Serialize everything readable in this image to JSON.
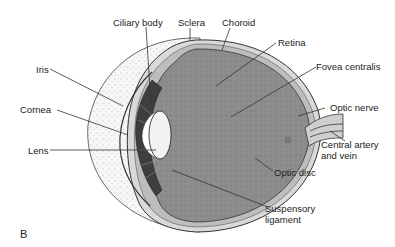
{
  "figure": {
    "panel_letter": "B"
  },
  "labels": {
    "ciliary_body": "Ciliary body",
    "sclera": "Sclera",
    "choroid": "Choroid",
    "retina": "Retina",
    "fovea_centralis": "Fovea centralis",
    "optic_nerve": "Optic nerve",
    "central_artery_line1": "Central artery",
    "central_artery_line2": "and vein",
    "optic_disc": "Optic disc",
    "suspensory_line1": "Suspensory",
    "suspensory_line2": "ligament",
    "iris": "Iris",
    "cornea": "Cornea",
    "lens": "Lens"
  },
  "colors": {
    "vitreous": "#8a8a8a",
    "sclera_band": "#d8d8d8",
    "outer_globe": "#f4f4f4",
    "line": "#333333"
  }
}
